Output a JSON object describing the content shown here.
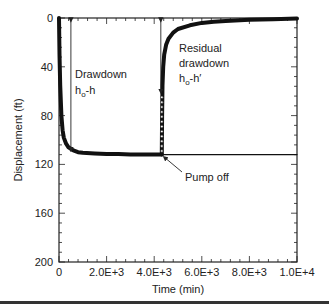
{
  "chart_data": {
    "type": "line",
    "title": "",
    "xlabel": "Time (min)",
    "ylabel": "Displacement (ft)",
    "xlim": [
      0,
      10000
    ],
    "ylim": [
      200,
      0
    ],
    "y_inverted": true,
    "grid": false,
    "legend": null,
    "x_ticks": [
      {
        "value": 0,
        "label": "0"
      },
      {
        "value": 2000,
        "label": "2.0E+3"
      },
      {
        "value": 4000,
        "label": "4.0E+3"
      },
      {
        "value": 6000,
        "label": "6.0E+3"
      },
      {
        "value": 8000,
        "label": "8.0E+3"
      },
      {
        "value": 10000,
        "label": "1.0E+4"
      }
    ],
    "y_ticks": [
      {
        "value": 0,
        "label": "0"
      },
      {
        "value": 40,
        "label": "40"
      },
      {
        "value": 80,
        "label": "80"
      },
      {
        "value": 120,
        "label": "120"
      },
      {
        "value": 160,
        "label": "160"
      },
      {
        "value": 200,
        "label": "200"
      }
    ],
    "pump_off_time": 4320,
    "series": [
      {
        "name": "Drawdown (pumping)",
        "x": [
          0,
          20,
          50,
          100,
          150,
          200,
          300,
          400,
          600,
          800,
          1000,
          1500,
          2000,
          2500,
          3000,
          3500,
          4000,
          4320
        ],
        "y": [
          0,
          30,
          55,
          80,
          92,
          98,
          103,
          106,
          108.5,
          110,
          110.5,
          111,
          111.5,
          111.5,
          112,
          112,
          112,
          112
        ]
      },
      {
        "name": "Recovery (residual drawdown)",
        "x": [
          4320,
          4330,
          4350,
          4380,
          4420,
          4500,
          4600,
          4800,
          5000,
          5500,
          6000,
          6500,
          7000,
          8000,
          9000,
          10000
        ],
        "y": [
          112,
          80,
          55,
          40,
          30,
          22,
          17,
          12,
          9,
          6,
          4,
          3,
          2.5,
          1.5,
          1,
          0.5
        ]
      },
      {
        "name": "Extrapolated pumping trend",
        "x": [
          4320,
          10000
        ],
        "y": [
          112,
          112
        ]
      }
    ],
    "annotations": [
      {
        "text_lines": [
          "Drawdown",
          "h₀-h"
        ],
        "arrow_x": 500,
        "arrow_y_from": 0,
        "arrow_y_to": 108
      },
      {
        "text_lines": [
          "Residual",
          "drawdown",
          "h₀-h′"
        ],
        "arrow_x": 4320,
        "arrow_y_from": 0,
        "arrow_y_to": 60
      },
      {
        "text_lines": [
          "Pump off"
        ],
        "points_to_x": 4320,
        "points_to_y": 112
      }
    ]
  },
  "labels": {
    "xlabel": "Time (min)",
    "ylabel": "Displacement (ft)",
    "drawdown_line1": "Drawdown",
    "drawdown_h": "h",
    "drawdown_sub": "o",
    "drawdown_rest": "-h",
    "residual_line1": "Residual",
    "residual_line2": "drawdown",
    "residual_h": "h",
    "residual_sub": "o",
    "residual_rest": "-h′",
    "pump_off": "Pump off"
  }
}
